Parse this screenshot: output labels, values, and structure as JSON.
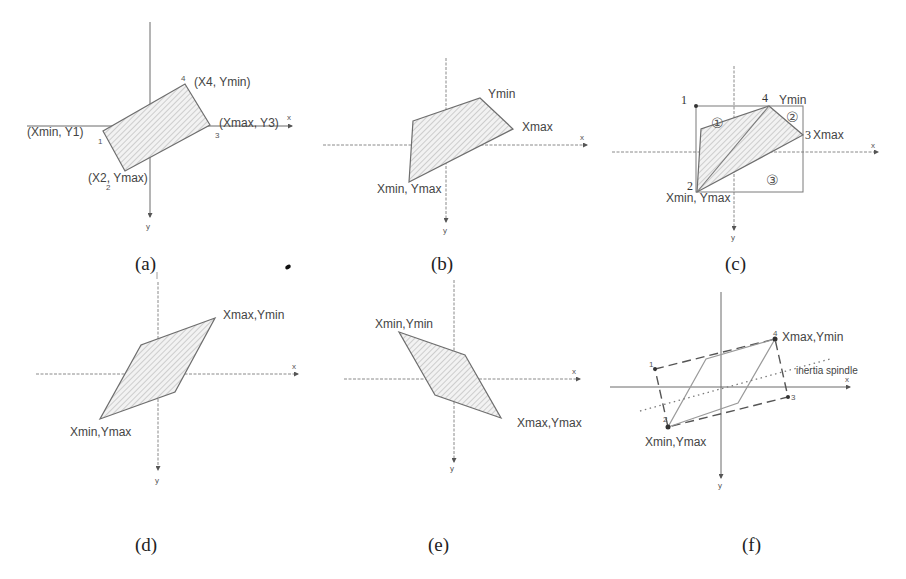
{
  "figure": {
    "panels": [
      {
        "id": "a",
        "caption": "(a)",
        "axis_x_label": "x",
        "axis_y_label": "y",
        "vertex_numbers": [
          "1",
          "2",
          "3",
          "4"
        ],
        "labels": {
          "v1": "(Xmin, Y1)",
          "v2": "(X2, Ymax)",
          "v3": "(Xmax, Y3)",
          "v4": "(X4, Ymin)"
        }
      },
      {
        "id": "b",
        "caption": "(b)",
        "axis_x_label": "x",
        "axis_y_label": "y",
        "labels": {
          "ymin": "Ymin",
          "xmax": "Xmax",
          "xmin_ymax": "Xmin, Ymax"
        }
      },
      {
        "id": "c",
        "caption": "(c)",
        "axis_x_label": "x",
        "axis_y_label": "y",
        "vertex_numbers": [
          "1",
          "2",
          "3",
          "4"
        ],
        "regions": [
          "①",
          "②",
          "③"
        ],
        "labels": {
          "ymin": "Ymin",
          "xmax": "Xmax",
          "xmin_ymax": "Xmin, Ymax"
        }
      },
      {
        "id": "d",
        "caption": "(d)",
        "axis_x_label": "x",
        "axis_y_label": "y",
        "labels": {
          "xmax_ymin": "Xmax,Ymin",
          "xmin_ymax": "Xmin,Ymax"
        }
      },
      {
        "id": "e",
        "caption": "(e)",
        "axis_x_label": "x",
        "axis_y_label": "y",
        "labels": {
          "xmin_ymin": "Xmin,Ymin",
          "xmax_ymax": "Xmax,Ymax"
        }
      },
      {
        "id": "f",
        "caption": "(f)",
        "axis_x_label": "x",
        "axis_y_label": "y",
        "vertex_numbers": [
          "1",
          "2",
          "3",
          "4"
        ],
        "labels": {
          "xmax_ymin": "Xmax,Ymin",
          "xmin_ymax": "Xmin,Ymax",
          "spindle": "inertia spindle"
        }
      }
    ]
  }
}
